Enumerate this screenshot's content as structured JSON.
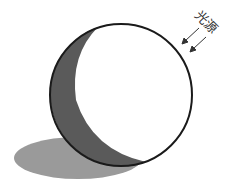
{
  "diagram": {
    "light_source_label": "光源",
    "elements": [
      "sphere",
      "shaded-crescent",
      "cast-shadow",
      "light-arrows"
    ],
    "colors": {
      "outline": "#1a1a1a",
      "crescent_fill": "#5a5a5a",
      "shadow_fill": "#9a9a9a",
      "arrow": "#333333",
      "background": "#ffffff"
    }
  }
}
